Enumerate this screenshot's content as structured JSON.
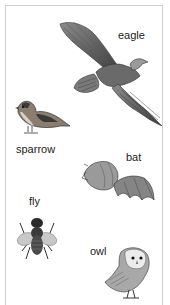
{
  "card": {
    "animals": [
      {
        "name": "eagle",
        "label": "eagle"
      },
      {
        "name": "sparrow",
        "label": "sparrow"
      },
      {
        "name": "bat",
        "label": "bat"
      },
      {
        "name": "fly",
        "label": "fly"
      },
      {
        "name": "owl",
        "label": "owl"
      }
    ]
  }
}
